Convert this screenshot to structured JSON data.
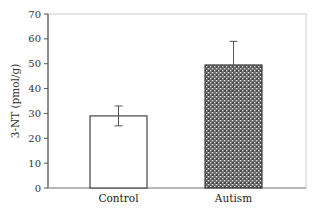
{
  "chart_data": {
    "type": "bar",
    "title": "",
    "xlabel": "",
    "ylabel": "3-NT (pmol/g)",
    "ylim": [
      0,
      70
    ],
    "yticks": [
      0,
      10,
      20,
      30,
      40,
      50,
      60,
      70
    ],
    "grid": false,
    "legend": null,
    "categories": [
      "Control",
      "Autism"
    ],
    "values": [
      29,
      49.5
    ],
    "error_bars": [
      {
        "lower": 25,
        "upper": 33
      },
      {
        "lower": 39,
        "upper": 59
      }
    ],
    "bar_styles": [
      {
        "fill": "#ffffff",
        "pattern": "none",
        "stroke": "#444444"
      },
      {
        "fill": "#555555",
        "pattern": "dense-dotted-hatch",
        "stroke": "#444444"
      }
    ]
  }
}
